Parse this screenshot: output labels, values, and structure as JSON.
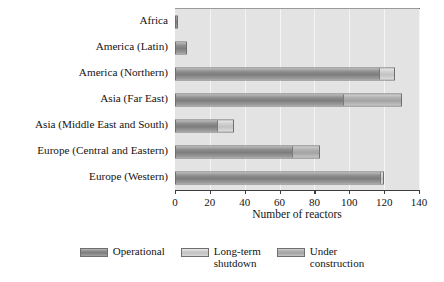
{
  "chart_data": {
    "type": "bar",
    "orientation": "horizontal",
    "stacked": true,
    "title": "",
    "xlabel": "Number of reactors",
    "ylabel": "",
    "xlim": [
      0,
      140
    ],
    "xticks": [
      0,
      20,
      40,
      60,
      80,
      100,
      120,
      140
    ],
    "grid": true,
    "grid_axis": "x",
    "legend_position": "bottom",
    "categories": [
      "Africa",
      "America (Latin)",
      "America (Northern)",
      "Asia (Far East)",
      "Asia (Middle East and South)",
      "Europe (Central and Eastern)",
      "Europe (Western)"
    ],
    "series": [
      {
        "name": "Operational",
        "color": "#8e8e8e",
        "values": [
          2,
          7,
          118,
          97,
          25,
          68,
          119
        ]
      },
      {
        "name": "Long-term shutdown",
        "color": "#cfcfcf",
        "values": [
          0,
          0,
          8,
          0,
          9,
          0,
          1
        ]
      },
      {
        "name": "Under construction",
        "color": "#b0b0b0",
        "values": [
          0,
          0,
          0,
          33,
          0,
          15,
          0
        ]
      }
    ],
    "totals": [
      2,
      7,
      126,
      130,
      34,
      83,
      120
    ]
  },
  "legend": {
    "items": [
      {
        "label": "Operational"
      },
      {
        "label": "Long-term\nshutdown"
      },
      {
        "label": "Under\nconstruction"
      }
    ]
  },
  "colors": {
    "plot_background": "#e3e3e3",
    "gridline": "#f4f4f4",
    "axis": "#3d3d3d",
    "text": "#141414",
    "operational": "#8e8e8e",
    "shutdown": "#cfcfcf",
    "construction": "#b0b0b0"
  }
}
